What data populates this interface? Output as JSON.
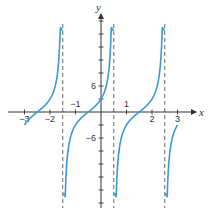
{
  "chart_data": {
    "type": "line",
    "title": "",
    "function": "y = 3tan(pi/2 * (x + 0.5))",
    "xlabel": "x",
    "ylabel": "y",
    "xlim": [
      -3.4,
      3.6
    ],
    "ylim": [
      -21,
      21
    ],
    "x_ticks": [
      -3,
      -2,
      -1,
      0,
      1,
      2,
      3
    ],
    "x_tick_labels": [
      "−3",
      "−2",
      "−1",
      "1",
      "2",
      "3"
    ],
    "y_tick_step": 3,
    "y_tick_labels": [
      "6",
      "−6"
    ],
    "asymptotes_x": [
      -1.5,
      0.5,
      2.5
    ],
    "zeros_x": [
      -2.5,
      -0.5,
      1.5
    ],
    "y_intercept": 3,
    "branches": [
      {
        "x_start": -3.0,
        "x_end": -1.55,
        "y_start": -3,
        "y_end": 19
      },
      {
        "x_start": -1.45,
        "x_end": 0.45,
        "y_start": -19,
        "y_end": 19
      },
      {
        "x_start": 0.55,
        "x_end": 2.45,
        "y_start": -19,
        "y_end": 19
      },
      {
        "x_start": 2.55,
        "x_end": 3.0,
        "y_start": -19,
        "y_end": -3
      }
    ],
    "colors": {
      "curve": "#3a9ad3",
      "axes": "#333333",
      "asymptote": "#555555"
    },
    "grid": false,
    "legend": null
  }
}
